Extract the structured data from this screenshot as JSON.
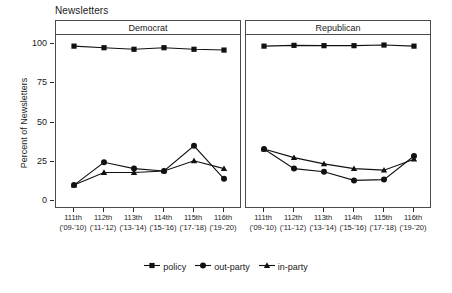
{
  "figure": {
    "title": "Newsletters",
    "ylabel": "Percent of Newsletters"
  },
  "chart_data": {
    "type": "line",
    "title": "Newsletters",
    "xlabel": "",
    "ylabel": "Percent of Newsletters",
    "ylim": [
      0,
      100
    ],
    "yticks": [
      0,
      25,
      50,
      75,
      100
    ],
    "grid": false,
    "legend_position": "bottom",
    "categories": [
      "111th",
      "112th",
      "113th",
      "114th",
      "115th",
      "116th"
    ],
    "category_sublabels": [
      "('09-'10)",
      "('11-'12)",
      "('13-'14)",
      "('15-'16)",
      "('17-'18)",
      "('19-'20)"
    ],
    "panels": [
      {
        "name": "Democrat",
        "series": [
          {
            "name": "policy",
            "marker": "square",
            "values": [
              98,
              97,
              96,
              97,
              96,
              95.5
            ]
          },
          {
            "name": "out-party",
            "marker": "circle",
            "values": [
              9.5,
              24,
              20,
              18.5,
              34.5,
              13.5
            ]
          },
          {
            "name": "in-party",
            "marker": "triangle",
            "values": [
              9.5,
              17.5,
              17.5,
              18.5,
              25,
              20
            ]
          }
        ]
      },
      {
        "name": "Republican",
        "series": [
          {
            "name": "policy",
            "marker": "square",
            "values": [
              98,
              98.5,
              98.3,
              98.3,
              98.7,
              98
            ]
          },
          {
            "name": "out-party",
            "marker": "circle",
            "values": [
              32.5,
              20,
              18,
              12.5,
              13,
              28
            ]
          },
          {
            "name": "in-party",
            "marker": "triangle",
            "values": [
              32.5,
              27,
              23,
              20,
              19,
              26
            ]
          }
        ]
      }
    ]
  },
  "legend": {
    "items": [
      {
        "label": "policy",
        "marker": "square-marker"
      },
      {
        "label": "out-party",
        "marker": "circle-marker"
      },
      {
        "label": "in-party",
        "marker": "triangle-marker"
      }
    ]
  },
  "colors": {
    "series": "#111111",
    "frame": "#4a4a4a",
    "text": "#1a1a1a",
    "background": "#ffffff"
  }
}
